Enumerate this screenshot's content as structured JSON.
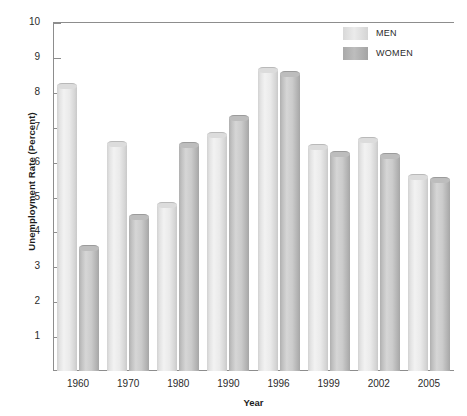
{
  "chart_data": {
    "type": "bar",
    "title": "",
    "xlabel": "Year",
    "ylabel": "Unemployment Rate (Percent)",
    "categories": [
      "1960",
      "1970",
      "1980",
      "1990",
      "1996",
      "1999",
      "2002",
      "2005"
    ],
    "series": [
      {
        "name": "MEN",
        "color": "#e4e4e4",
        "values": [
          8.25,
          6.6,
          4.85,
          6.85,
          8.7,
          6.5,
          6.7,
          5.65
        ]
      },
      {
        "name": "WOMEN",
        "color": "#b8b8b8",
        "values": [
          3.6,
          4.5,
          6.55,
          7.35,
          8.6,
          6.3,
          6.25,
          5.55
        ]
      }
    ],
    "ylim": [
      0,
      10
    ],
    "yticks": [
      "10",
      "9",
      "8",
      "7",
      "6",
      "5",
      "4",
      "3",
      "2",
      "1"
    ],
    "ytick_values": [
      10,
      9,
      8,
      7,
      6,
      5,
      4,
      3,
      2,
      1
    ],
    "grid": false,
    "legend_position": "top-right",
    "legend": [
      "MEN",
      "WOMEN"
    ]
  },
  "axes": {
    "y_title": "Unemployment Rate (Percent)",
    "x_title": "Year"
  },
  "legend": {
    "men_label": "MEN",
    "women_label": "WOMEN"
  }
}
